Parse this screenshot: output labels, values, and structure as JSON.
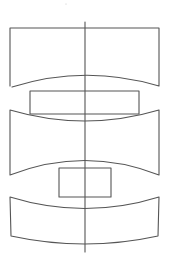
{
  "diagram": {
    "width": 170,
    "height": 262,
    "background": "#ffffff",
    "stroke_color": "#555555",
    "stroke_width": 1.1,
    "axis": {
      "x": 85,
      "y1": 22,
      "y2": 252
    },
    "segments": [
      {
        "name": "top-segment",
        "path": "M10 86 L10 28 L159 28 L159 86 Q85 64 12 87"
      },
      {
        "name": "middle-segment",
        "path": "M10 110 Q85 132 159 110 L159 175 Q85 146 10 175 Z"
      },
      {
        "name": "bottom-segment",
        "path": "M10 197 Q85 220 159 197 L158 236 Q85 252 11 236 Z"
      }
    ],
    "inner_rects": [
      {
        "name": "upper-inner-rect",
        "x": 30,
        "y": 91,
        "w": 109,
        "h": 23
      },
      {
        "name": "lower-inner-rect",
        "x": 59,
        "y": 168,
        "w": 52,
        "h": 29
      }
    ],
    "specks": [
      {
        "x": 66,
        "y": 4,
        "r": 0.5
      }
    ]
  }
}
